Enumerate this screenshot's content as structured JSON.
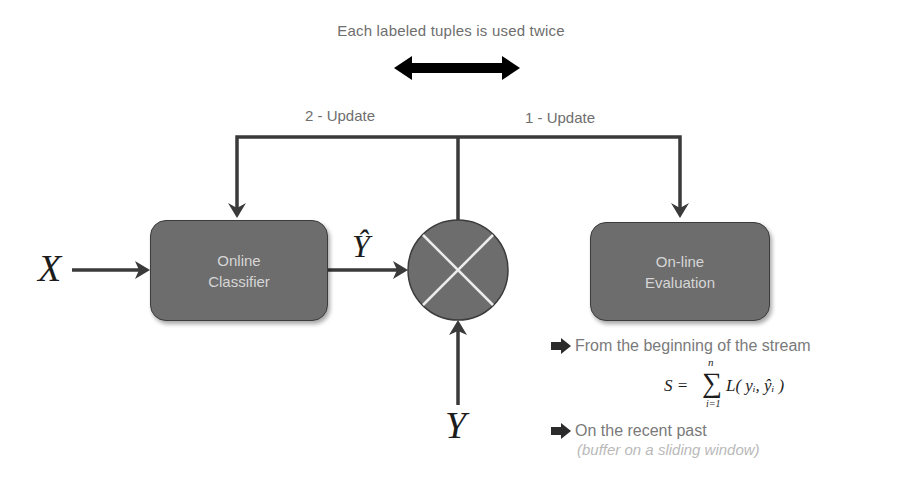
{
  "caption": "Each labeled tuples is used twice",
  "update_labels": {
    "left": "2 - Update",
    "right": "1 - Update"
  },
  "boxes": {
    "classifier": {
      "line1": "Online",
      "line2": "Classifier"
    },
    "evaluation": {
      "line1": "On-line",
      "line2": "Evaluation"
    }
  },
  "variables": {
    "input": "X",
    "prediction": "Ŷ",
    "true_label": "Y"
  },
  "comparator": {
    "symbol": "cross-circle"
  },
  "bullets": [
    {
      "icon": "right-arrow-icon",
      "text": "From the beginning of the stream"
    },
    {
      "icon": "right-arrow-icon",
      "text": "On the recent past",
      "subtext": "(buffer on a sliding window)"
    }
  ],
  "formula": {
    "lhs": "S =",
    "operator": "∑",
    "upper": "n",
    "lower": "i=1",
    "body": "L( yᵢ, ŷᵢ )"
  },
  "colors": {
    "box_fill": "#6d6d6d",
    "box_border": "#3c3c3c",
    "box_text": "#d6d6d6",
    "line": "#3a3a3a",
    "label_text": "#6e6e6e",
    "double_arrow": "#000000"
  }
}
